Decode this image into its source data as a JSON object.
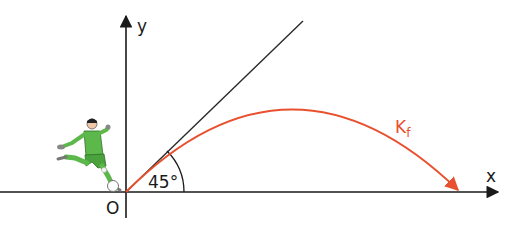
{
  "diagram": {
    "axes": {
      "x_label": "x",
      "y_label": "y",
      "origin_label": "O"
    },
    "angle_label": "45°",
    "curve_label": {
      "main": "K",
      "subscript": "f"
    },
    "colors": {
      "axis": "#1a1a1a",
      "tangent_line": "#2a2a2a",
      "curve": "#e8502e",
      "player_shirt": "#5cb84a",
      "player_dark": "#2f6e2a"
    },
    "figure": "soccer-player-kicking-ball"
  }
}
